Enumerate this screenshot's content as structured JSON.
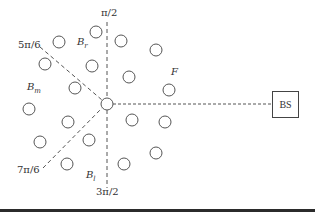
{
  "diagram": {
    "center": {
      "x": 107,
      "y": 104,
      "r": 6
    },
    "nodes": [
      {
        "x": 96,
        "y": 32
      },
      {
        "x": 59,
        "y": 42
      },
      {
        "x": 121,
        "y": 41
      },
      {
        "x": 156,
        "y": 50
      },
      {
        "x": 45,
        "y": 64
      },
      {
        "x": 92,
        "y": 66
      },
      {
        "x": 129,
        "y": 77
      },
      {
        "x": 169,
        "y": 90
      },
      {
        "x": 75,
        "y": 88
      },
      {
        "x": 29,
        "y": 109
      },
      {
        "x": 68,
        "y": 122
      },
      {
        "x": 132,
        "y": 120
      },
      {
        "x": 165,
        "y": 122
      },
      {
        "x": 40,
        "y": 142
      },
      {
        "x": 89,
        "y": 140
      },
      {
        "x": 156,
        "y": 153
      },
      {
        "x": 67,
        "y": 164
      },
      {
        "x": 124,
        "y": 164
      }
    ],
    "node_radius": 6,
    "angle_labels": {
      "pi_2": "π/2",
      "five_pi_6": "5π/6",
      "seven_pi_6": "7π/6",
      "three_pi_2": "3π/2"
    },
    "region_labels": {
      "b_r": {
        "base": "B",
        "sub": "r"
      },
      "b_m": {
        "base": "B",
        "sub": "m"
      },
      "b_l": {
        "base": "B",
        "sub": "l"
      },
      "f": "F"
    },
    "base_station": "BS",
    "colors": {
      "stroke": "#555555",
      "text": "#333333"
    }
  }
}
